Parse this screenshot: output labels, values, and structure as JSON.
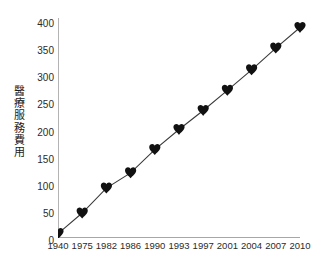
{
  "chart_data": {
    "type": "line",
    "title": "",
    "subtitle": "",
    "xlabel": "",
    "ylabel": "醫療服務費用",
    "ylabel_chars": [
      "醫",
      "療",
      "服",
      "務",
      "費",
      "用"
    ],
    "categories": [
      "1940",
      "1975",
      "1982",
      "1986",
      "1990",
      "1993",
      "1997",
      "2001",
      "2004",
      "2007",
      "2010"
    ],
    "x": [
      1940,
      1975,
      1982,
      1986,
      1990,
      1993,
      1997,
      2001,
      2004,
      2007,
      2010
    ],
    "values": [
      8,
      46,
      92,
      120,
      163,
      200,
      235,
      272,
      310,
      350,
      388
    ],
    "series": [
      {
        "name": "醫療服務費用",
        "marker": "heart",
        "values": [
          8,
          46,
          92,
          120,
          163,
          200,
          235,
          272,
          310,
          350,
          388
        ]
      }
    ],
    "ylim": [
      0,
      400
    ],
    "yticks": [
      0,
      50,
      100,
      150,
      200,
      250,
      300,
      350,
      400
    ],
    "ytick_labels": [
      "0",
      "50",
      "100",
      "150",
      "200",
      "250",
      "300",
      "350",
      "400"
    ],
    "xtick_labels": [
      "1940",
      "1975",
      "1982",
      "1986",
      "1990",
      "1993",
      "1997",
      "2001",
      "2004",
      "2007",
      "2010"
    ],
    "minor_ticks": true,
    "grid": false,
    "legend": null,
    "legend_position": "none",
    "line_color": "#3a3a3a",
    "marker_color": "#111111",
    "axis_color": "#8a8a8a",
    "background_color": "#ffffff",
    "text_color": "#2b2b2b"
  }
}
